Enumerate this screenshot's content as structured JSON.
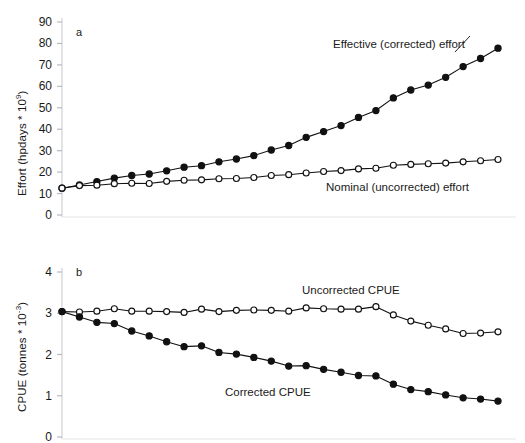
{
  "figure": {
    "panels": [
      {
        "id": "a",
        "letter": "a",
        "ylabel_main": "Effort (hpdays * 10",
        "ylabel_exp": "9",
        "ylabel_tail": ")"
      },
      {
        "id": "b",
        "letter": "b",
        "ylabel_main": "CPUE (tonnes * 10",
        "ylabel_exp": "-3",
        "ylabel_tail": ")"
      }
    ]
  },
  "chart_data": [
    {
      "type": "line",
      "panel": "a",
      "title": "",
      "xlabel": "",
      "ylabel": "Effort (hpdays * 10^9)",
      "ylim": [
        0,
        90
      ],
      "yticks": [
        0,
        10,
        20,
        30,
        40,
        50,
        60,
        70,
        80,
        90
      ],
      "ytick_labels": [
        "0",
        "10",
        "20",
        "30",
        "40",
        "50",
        "60",
        "70",
        "80",
        "90"
      ],
      "grid": false,
      "legend": "inline-annotations",
      "x": [
        1,
        2,
        3,
        4,
        5,
        6,
        7,
        8,
        9,
        10,
        11,
        12,
        13,
        14,
        15,
        16,
        17,
        18,
        19,
        20,
        21,
        22,
        23,
        24,
        25,
        26,
        27,
        28,
        29,
        30
      ],
      "series": [
        {
          "name": "Effective (corrected) effort",
          "marker": "filled-circle",
          "values": [
            12.5,
            14.0,
            15.6,
            17.2,
            18.4,
            19.1,
            20.6,
            22.3,
            23.0,
            24.8,
            26.1,
            27.7,
            30.3,
            32.4,
            36.2,
            38.9,
            41.7,
            45.5,
            48.7,
            54.6,
            58.3,
            60.6,
            64.2,
            69.2,
            73.0,
            77.8
          ]
        },
        {
          "name": "Nominal (uncorrected) effort",
          "marker": "open-circle",
          "values": [
            12.5,
            13.7,
            13.9,
            14.6,
            14.8,
            14.7,
            15.7,
            16.2,
            16.4,
            16.9,
            17.0,
            17.5,
            18.4,
            18.8,
            19.6,
            20.3,
            20.7,
            21.5,
            21.8,
            23.2,
            23.6,
            23.9,
            24.2,
            24.8,
            25.3,
            25.9
          ]
        }
      ]
    },
    {
      "type": "line",
      "panel": "b",
      "title": "",
      "xlabel": "",
      "ylabel": "CPUE (tonnes * 10^-3)",
      "ylim": [
        0,
        4
      ],
      "yticks": [
        0,
        1,
        2,
        3,
        4
      ],
      "ytick_labels": [
        "0",
        "1",
        "2",
        "3",
        "4"
      ],
      "grid": false,
      "legend": "inline-annotations",
      "x": [
        1,
        2,
        3,
        4,
        5,
        6,
        7,
        8,
        9,
        10,
        11,
        12,
        13,
        14,
        15,
        16,
        17,
        18,
        19,
        20,
        21,
        22,
        23,
        24,
        25,
        26,
        27,
        28,
        29,
        30
      ],
      "series": [
        {
          "name": "Uncorrected CPUE",
          "marker": "open-circle",
          "values": [
            3.04,
            3.03,
            3.05,
            3.11,
            3.05,
            3.05,
            3.04,
            3.02,
            3.1,
            3.04,
            3.07,
            3.08,
            3.07,
            3.05,
            3.13,
            3.11,
            3.1,
            3.1,
            3.16,
            2.96,
            2.81,
            2.71,
            2.62,
            2.51,
            2.52,
            2.55
          ]
        },
        {
          "name": "Corrected CPUE",
          "marker": "filled-circle",
          "values": [
            3.04,
            2.91,
            2.78,
            2.75,
            2.57,
            2.45,
            2.31,
            2.19,
            2.21,
            2.05,
            2.01,
            1.93,
            1.84,
            1.72,
            1.73,
            1.64,
            1.57,
            1.49,
            1.48,
            1.28,
            1.15,
            1.1,
            1.02,
            0.95,
            0.92,
            0.87
          ]
        }
      ]
    }
  ]
}
